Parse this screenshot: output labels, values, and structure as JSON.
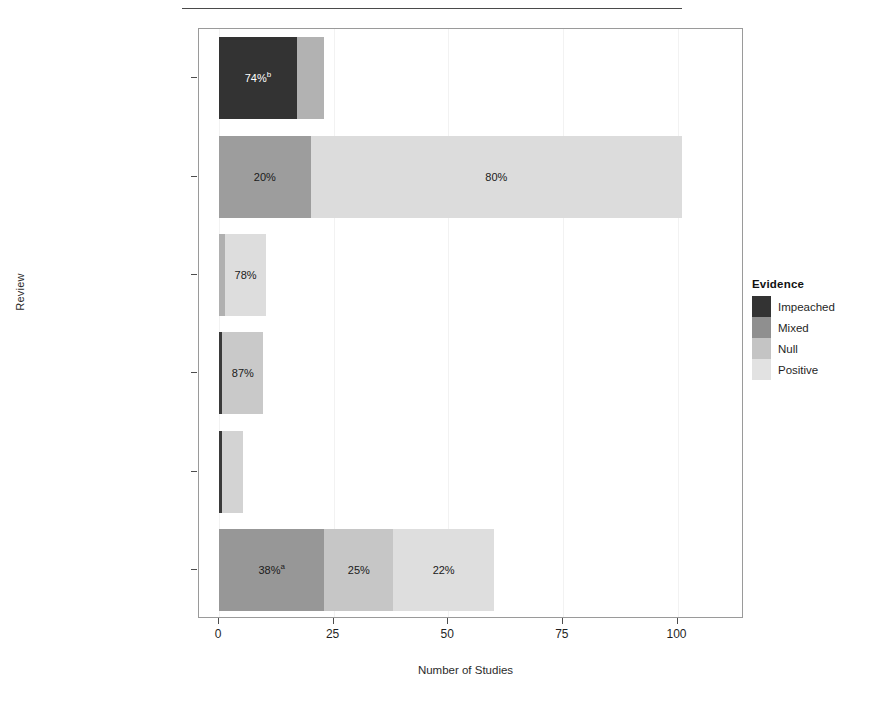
{
  "chart_data": {
    "type": "bar",
    "orientation": "horizontal",
    "stacked": true,
    "title": "",
    "xlabel": "Number of Studies",
    "ylabel": "Review",
    "xlim": [
      0,
      109
    ],
    "xticks": [
      0,
      25,
      50,
      75,
      100
    ],
    "xtick_labels": [
      "0",
      "25",
      "50",
      "75",
      "100"
    ],
    "grid": false,
    "legend": {
      "title": "Evidence",
      "position": "right",
      "entries": [
        {
          "name": "Impeached",
          "color": "#333333"
        },
        {
          "name": "Mixed",
          "color": "#8f8f8f"
        },
        {
          "name": "Null",
          "color": "#c4c4c4"
        },
        {
          "name": "Positive",
          "color": "#e2e2e2"
        }
      ]
    },
    "categories": [
      "Rachman 1971",
      "Meltzoff & Kornreich 1970",
      "Luborsky et al. 1975",
      "Eysenck 1966",
      "Eysenck 1961",
      "Bergin 1971"
    ],
    "series": [
      {
        "name": "Impeached",
        "color": "#333333",
        "values": [
          17.0,
          0,
          0,
          0.7,
          0.7,
          0
        ]
      },
      {
        "name": "Mixed",
        "color": "#8f8f8f",
        "values": [
          6.0,
          20.0,
          1.3,
          0,
          0,
          23.0
        ]
      },
      {
        "name": "Null",
        "color": "#c4c4c4",
        "values": [
          0,
          0,
          0,
          9.0,
          0,
          15.0
        ]
      },
      {
        "name": "Positive",
        "color": "#e2e2e2",
        "values": [
          0,
          81.0,
          9.0,
          0,
          4.5,
          22.0
        ]
      }
    ],
    "bars": [
      {
        "category": "Rachman 1971",
        "total": 23.0,
        "segments": [
          {
            "evidence": "Impeached",
            "value": 17.0,
            "color": "#333333",
            "label": "74%",
            "superscript": "b",
            "label_color": "#ffffff"
          },
          {
            "evidence": "Mixed",
            "value": 6.0,
            "color": "#b2b2b2",
            "label": "",
            "superscript": "",
            "label_color": "#1a1a1a"
          }
        ]
      },
      {
        "category": "Meltzoff & Kornreich 1970",
        "total": 101.0,
        "segments": [
          {
            "evidence": "Mixed",
            "value": 20.0,
            "color": "#9d9d9d",
            "label": "20%",
            "superscript": "",
            "label_color": "#1a1a1a"
          },
          {
            "evidence": "Positive",
            "value": 81.0,
            "color": "#dcdcdc",
            "label": "80%",
            "superscript": "",
            "label_color": "#1a1a1a"
          }
        ]
      },
      {
        "category": "Luborsky et al. 1975",
        "total": 10.3,
        "segments": [
          {
            "evidence": "Mixed",
            "value": 1.3,
            "color": "#b0b0b0",
            "label": "",
            "superscript": "",
            "label_color": "#1a1a1a"
          },
          {
            "evidence": "Positive",
            "value": 9.0,
            "color": "#dddddd",
            "label": "78%",
            "superscript": "",
            "label_color": "#1a1a1a"
          }
        ]
      },
      {
        "category": "Eysenck 1966",
        "total": 9.7,
        "segments": [
          {
            "evidence": "Impeached",
            "value": 0.7,
            "color": "#3a3a3a",
            "label": "",
            "superscript": "",
            "label_color": "#ffffff"
          },
          {
            "evidence": "Null",
            "value": 9.0,
            "color": "#c9c9c9",
            "label": "87%",
            "superscript": "",
            "label_color": "#1a1a1a"
          }
        ]
      },
      {
        "category": "Eysenck 1961",
        "total": 5.2,
        "segments": [
          {
            "evidence": "Impeached",
            "value": 0.7,
            "color": "#3a3a3a",
            "label": "",
            "superscript": "",
            "label_color": "#ffffff"
          },
          {
            "evidence": "Positive",
            "value": 4.5,
            "color": "#d3d3d3",
            "label": "",
            "superscript": "",
            "label_color": "#1a1a1a"
          }
        ]
      },
      {
        "category": "Bergin 1971",
        "total": 60.0,
        "segments": [
          {
            "evidence": "Mixed",
            "value": 23.0,
            "color": "#979797",
            "label": "38%",
            "superscript": "a",
            "label_color": "#1a1a1a"
          },
          {
            "evidence": "Null",
            "value": 15.0,
            "color": "#c6c6c6",
            "label": "25%",
            "superscript": "",
            "label_color": "#1a1a1a"
          },
          {
            "evidence": "Positive",
            "value": 22.0,
            "color": "#dedede",
            "label": "22%",
            "superscript": "",
            "label_color": "#1a1a1a"
          }
        ]
      }
    ]
  }
}
